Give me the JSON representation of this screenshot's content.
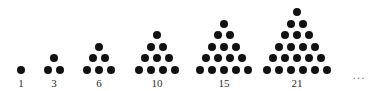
{
  "figure": {
    "background_color": "#ffffff",
    "dot_color": "#111111",
    "label_color": "#2b2b2b",
    "ellipsis_color": "#888888",
    "dot_diameter": 8,
    "row_spacing": 11.6,
    "column_spacing": 12,
    "baseline_y": 70,
    "label_y": 77
  },
  "chart_data": {
    "type": "scatter",
    "xlabel": "",
    "ylabel": "",
    "categories": [
      "1",
      "3",
      "6",
      "10",
      "15",
      "21"
    ],
    "values": [
      1,
      3,
      6,
      10,
      15,
      21
    ],
    "series": [
      {
        "name": "triangular numbers",
        "values": [
          1,
          3,
          6,
          10,
          15,
          21
        ]
      },
      {
        "name": "rows per figure",
        "values": [
          1,
          2,
          3,
          4,
          5,
          6
        ]
      }
    ],
    "annotations": [
      "1",
      "3",
      "6",
      "10",
      "15",
      "21",
      "…"
    ],
    "legend": [],
    "grid": false
  },
  "groups": [
    {
      "label": "1",
      "dots": 1,
      "rows": 1,
      "center_x": 21
    },
    {
      "label": "3",
      "dots": 3,
      "rows": 2,
      "center_x": 54
    },
    {
      "label": "6",
      "dots": 6,
      "rows": 3,
      "center_x": 99
    },
    {
      "label": "10",
      "dots": 10,
      "rows": 4,
      "center_x": 157
    },
    {
      "label": "15",
      "dots": 15,
      "rows": 5,
      "center_x": 224
    },
    {
      "label": "21",
      "dots": 21,
      "rows": 6,
      "center_x": 297
    }
  ],
  "ellipsis": {
    "text": "…",
    "x": 352,
    "y": 68
  }
}
